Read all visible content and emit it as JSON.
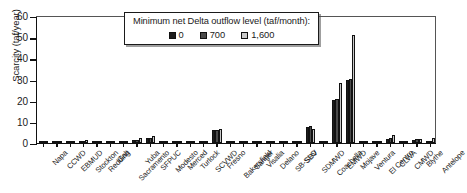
{
  "chart_data": {
    "type": "bar",
    "title": "",
    "xlabel": "",
    "ylabel": "Scarcity (taf/year)",
    "ylim": [
      0,
      60
    ],
    "yticks": [
      0,
      10,
      20,
      30,
      40,
      50,
      60
    ],
    "grid": false,
    "legend_position": "top-center",
    "legend_title": "Minimum net Delta outflow level (taf/month):",
    "categories": [
      "Napa",
      "CCWD",
      "EBMUD",
      "Stockton",
      "Redding",
      "Galt",
      "Sacramento",
      "Yuba",
      "SFPUC",
      "Modesto",
      "Merced",
      "Turlock",
      "SCVWD",
      "Fresno",
      "Bakersfield",
      "Sanger",
      "Visalia",
      "Delano",
      "SB-SLO",
      "SBV",
      "SDMWD",
      "Coachella",
      "EMWD",
      "Mojave",
      "Ventura",
      "El Centro",
      "CLWA",
      "CMWD",
      "Blythe",
      "Antelope"
    ],
    "series": [
      {
        "name": "0",
        "color": "#1d1d1d",
        "values": [
          0,
          0,
          0,
          1.0,
          0.9,
          0,
          0,
          1.2,
          2.3,
          0,
          0,
          0,
          0,
          6.0,
          0,
          0,
          0,
          0,
          0,
          0,
          7.8,
          0,
          20.5,
          29.8,
          0,
          0,
          2.0,
          0,
          1.5,
          0
        ]
      },
      {
        "name": "700",
        "color": "#4a4a4a",
        "values": [
          0,
          0,
          0,
          1.1,
          1.0,
          0,
          0,
          1.5,
          2.6,
          0,
          0,
          0,
          0,
          6.2,
          0,
          0,
          0,
          0,
          0,
          0,
          8.0,
          0,
          21.0,
          30.2,
          0,
          0,
          2.6,
          0,
          1.7,
          0
        ]
      },
      {
        "name": "1,600",
        "color": "#c9c9c9",
        "values": [
          0,
          0,
          0,
          1.2,
          1.1,
          0,
          0,
          2.2,
          3.2,
          0,
          0,
          0,
          0,
          6.4,
          0,
          0,
          0,
          0,
          0,
          0,
          6.6,
          0,
          28.5,
          51.0,
          0,
          0,
          4.0,
          0,
          2.0,
          2.6
        ]
      }
    ]
  }
}
